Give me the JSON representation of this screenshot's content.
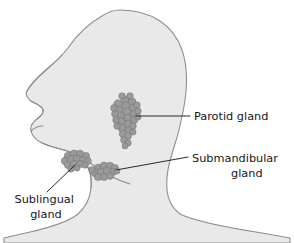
{
  "figure": {
    "name": "salivary-glands-head-profile",
    "background_color": "#ffffff"
  },
  "anatomy": {
    "head": {
      "name": "head-silhouette",
      "description": "Left-facing lateral profile of human head, neck and shoulders",
      "fill_color": "#e9e9e9",
      "outline_color": "#8e8e8e",
      "outline_width": 1
    },
    "face_profile": {
      "name": "face-profile-line",
      "description": "Nose, lips and chin contour line",
      "stroke_color": "#8e8e8e"
    }
  },
  "glands": [
    {
      "id": "parotid",
      "name": "parotid-gland-cluster",
      "label": "Parotid gland",
      "fill_color": "#9a9a9a",
      "outline_color": "#6f6f6f",
      "center": [
        126,
        122
      ],
      "shape": "vertical grape-like acinar cluster"
    },
    {
      "id": "submandibular",
      "name": "submandibular-gland-cluster",
      "label": "Submandibular gland",
      "fill_color": "#9a9a9a",
      "outline_color": "#6f6f6f",
      "center": [
        107,
        171
      ],
      "shape": "small horizontal acinar cluster"
    },
    {
      "id": "sublingual",
      "name": "sublingual-gland-cluster",
      "label": "Sublingual gland",
      "fill_color": "#9a9a9a",
      "outline_color": "#6f6f6f",
      "center": [
        77,
        160
      ],
      "shape": "small oval acinar cluster"
    }
  ],
  "labels": {
    "parotid": {
      "name": "parotid-gland-label",
      "lines": [
        "Parotid gland"
      ],
      "line1": "Parotid gland",
      "anchor": "start",
      "x": 194,
      "y": 120,
      "color": "#161616"
    },
    "submandibular": {
      "name": "submandibular-gland-label",
      "lines": [
        "Submandibular",
        "gland"
      ],
      "line1": "Submandibular",
      "line2": "gland",
      "anchor": "start",
      "x": 192,
      "y": 162,
      "color": "#161616"
    },
    "sublingual": {
      "name": "sublingual-gland-label",
      "lines": [
        "Sublingual",
        "gland"
      ],
      "line1": "Sublingual",
      "line2": "gland",
      "anchor": "middle",
      "x": 46,
      "y": 203,
      "color": "#161616"
    }
  },
  "leader_lines": [
    {
      "name": "parotid-leader-line",
      "from": [
        136,
        116
      ],
      "to": [
        190,
        116
      ],
      "stroke_color": "#2a2a2a"
    },
    {
      "name": "submandibular-leader-line",
      "from": [
        116,
        170
      ],
      "to": [
        188,
        157
      ],
      "stroke_color": "#2a2a2a"
    },
    {
      "name": "sublingual-leader-line",
      "from": [
        75,
        165
      ],
      "to": [
        47,
        192
      ],
      "stroke_color": "#2a2a2a"
    }
  ]
}
